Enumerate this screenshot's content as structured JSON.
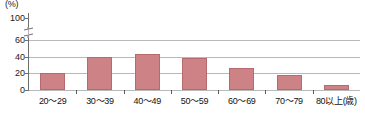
{
  "chart": {
    "unit_label": "(%)",
    "y_ticks": [
      "100",
      "60",
      "40",
      "20",
      "0"
    ],
    "axis_break_icon": "axis-break-squiggle"
  },
  "chart_data": {
    "type": "bar",
    "title": "",
    "subtitle": "",
    "xlabel": "(歳)",
    "ylabel": "(%)",
    "categories": [
      "20〜29",
      "30〜39",
      "40〜49",
      "50〜59",
      "60〜69",
      "70〜79",
      "80以上(歳)"
    ],
    "values": [
      20,
      40,
      43,
      38,
      27,
      18,
      6
    ],
    "ylim": [
      0,
      100
    ],
    "y_tick_values": [
      100,
      60,
      40,
      20,
      0
    ],
    "axis_break": {
      "between": [
        60,
        100
      ],
      "present": true
    },
    "grid": {
      "horizontal": true,
      "vertical": false
    },
    "legend": {
      "visible": false,
      "position": "none"
    },
    "series": [
      {
        "name": "",
        "color": "#cd8286",
        "values": [
          20,
          40,
          43,
          38,
          27,
          18,
          6
        ]
      }
    ]
  }
}
